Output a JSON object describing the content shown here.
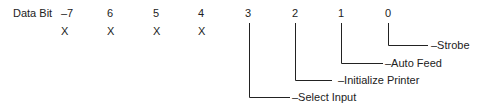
{
  "header_label": "Data Bit",
  "bits": [
    {
      "number": "–7",
      "value": "X"
    },
    {
      "number": "6",
      "value": "X"
    },
    {
      "number": "5",
      "value": "X"
    },
    {
      "number": "4",
      "value": "X"
    },
    {
      "number": "3",
      "signal": "–Select Input"
    },
    {
      "number": "2",
      "signal": "–Initialize Printer"
    },
    {
      "number": "1",
      "signal": "–Auto Feed"
    },
    {
      "number": "0",
      "signal": "–Strobe"
    }
  ],
  "line_color": "#222222"
}
